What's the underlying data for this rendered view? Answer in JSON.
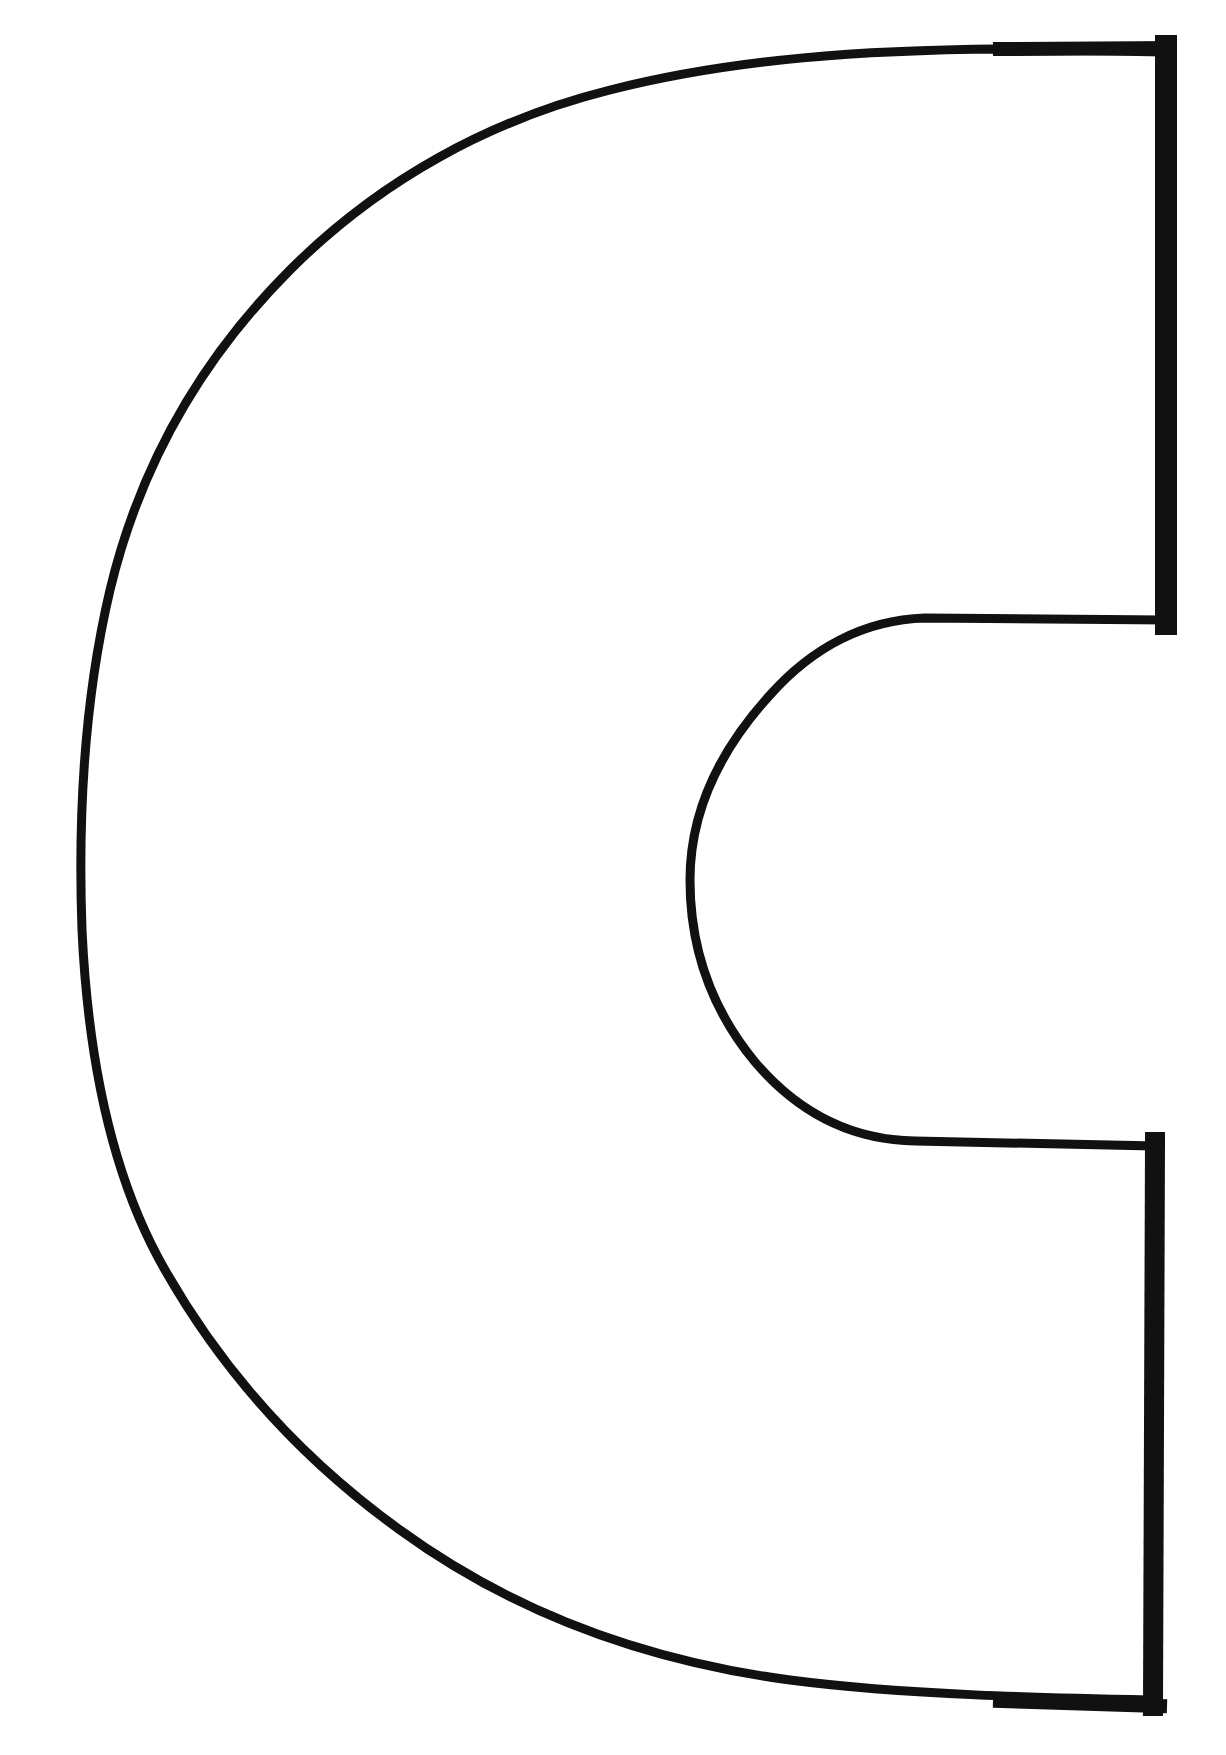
{
  "figure": {
    "subject": "C",
    "colors": {
      "background": "#ffffff",
      "stroke": "#111111",
      "fill": "#ffffff"
    }
  }
}
